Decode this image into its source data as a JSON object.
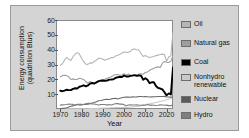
{
  "chart_data": {
    "type": "line",
    "title": "",
    "xlabel": "Year",
    "ylabel_line1": "Energy consumption",
    "ylabel_line2": "(quadrillion Btus)",
    "xlim": [
      1968,
      2023
    ],
    "ylim": [
      0,
      60
    ],
    "xticks": [
      1970,
      1980,
      1990,
      2000,
      2010,
      2020
    ],
    "yticks": [
      10,
      20,
      30,
      40,
      50,
      60
    ],
    "grid": false,
    "legend_position": "right",
    "x": [
      1970,
      1971,
      1972,
      1973,
      1974,
      1975,
      1976,
      1977,
      1978,
      1979,
      1980,
      1981,
      1982,
      1983,
      1984,
      1985,
      1986,
      1987,
      1988,
      1989,
      1990,
      1991,
      1992,
      1993,
      1994,
      1995,
      1996,
      1997,
      1998,
      1999,
      2000,
      2001,
      2002,
      2003,
      2004,
      2005,
      2006,
      2007,
      2008,
      2009,
      2010,
      2011,
      2012,
      2013,
      2014,
      2015,
      2016,
      2017,
      2018,
      2019,
      2020,
      2021,
      2022
    ],
    "series": [
      {
        "name": "Oil",
        "color": "#b5b5b5",
        "width": 1.1,
        "values": [
          29.5,
          30.5,
          32.9,
          34.8,
          33.5,
          32.7,
          35.2,
          37.1,
          38.0,
          37.1,
          34.2,
          31.9,
          30.2,
          30.1,
          31.1,
          30.9,
          32.2,
          32.9,
          34.2,
          34.2,
          33.6,
          32.8,
          33.5,
          33.8,
          34.7,
          34.6,
          35.8,
          36.3,
          36.8,
          37.8,
          38.4,
          38.3,
          38.2,
          38.8,
          40.3,
          40.4,
          39.9,
          39.8,
          37.3,
          35.4,
          36.0,
          35.3,
          34.7,
          35.1,
          35.4,
          36.0,
          36.3,
          36.7,
          37.0,
          36.7,
          32.2,
          35.1,
          35.9
        ],
        "extrapolated_end": 52.0
      },
      {
        "name": "Natural gas",
        "color": "#9e9e9e",
        "width": 1.1,
        "values": [
          21.8,
          22.5,
          22.7,
          22.5,
          21.7,
          19.9,
          20.3,
          19.9,
          20.0,
          20.7,
          20.4,
          19.9,
          18.5,
          17.4,
          18.5,
          17.8,
          16.7,
          17.7,
          18.6,
          19.7,
          19.7,
          20.1,
          20.7,
          21.2,
          21.7,
          22.7,
          23.1,
          23.2,
          22.8,
          22.9,
          23.8,
          22.8,
          23.6,
          22.8,
          22.9,
          22.6,
          22.2,
          23.6,
          23.8,
          23.4,
          24.6,
          24.9,
          26.1,
          26.8,
          27.5,
          28.2,
          28.4,
          28.0,
          30.9,
          32.0,
          31.5,
          31.3,
          32.3
        ],
        "extrapolated_end": 36.0
      },
      {
        "name": "Coal",
        "color": "#000000",
        "width": 1.9,
        "values": [
          12.3,
          12.0,
          12.4,
          13.0,
          12.7,
          12.7,
          13.6,
          14.0,
          13.8,
          15.0,
          15.4,
          16.0,
          15.3,
          15.9,
          17.1,
          17.5,
          17.3,
          18.0,
          18.8,
          19.0,
          19.2,
          19.0,
          19.1,
          19.8,
          19.9,
          20.1,
          21.0,
          21.4,
          21.7,
          21.6,
          22.6,
          21.9,
          21.9,
          22.3,
          22.5,
          22.8,
          22.4,
          22.7,
          22.4,
          19.7,
          20.8,
          19.7,
          17.4,
          18.0,
          18.0,
          15.5,
          14.2,
          13.8,
          13.2,
          11.3,
          9.2,
          10.5,
          9.8
        ],
        "extrapolated_end": 28.0
      },
      {
        "name": "Nonhydro renewable",
        "color": "#c9c9c9",
        "width": 1.1,
        "values": [
          0.1,
          0.1,
          0.1,
          0.1,
          0.1,
          0.1,
          0.1,
          0.1,
          0.1,
          0.1,
          0.1,
          0.1,
          0.2,
          0.2,
          0.3,
          0.3,
          0.3,
          0.3,
          0.4,
          0.5,
          0.6,
          0.6,
          0.7,
          0.7,
          0.8,
          0.8,
          0.9,
          0.9,
          1.0,
          1.0,
          1.1,
          1.1,
          1.2,
          1.3,
          1.4,
          1.5,
          1.7,
          1.9,
          2.2,
          2.5,
          2.8,
          3.3,
          3.5,
          3.8,
          4.1,
          4.4,
          4.7,
          5.1,
          5.4,
          5.7,
          6.2,
          6.7,
          7.0
        ],
        "extrapolated_end": 8.2
      },
      {
        "name": "Nuclear",
        "color": "#6a6a6a",
        "width": 1.1,
        "values": [
          0.2,
          0.4,
          0.6,
          0.9,
          1.3,
          1.9,
          2.1,
          2.7,
          3.0,
          2.8,
          2.7,
          3.0,
          3.1,
          3.2,
          3.6,
          4.1,
          4.4,
          4.9,
          5.6,
          5.7,
          6.1,
          6.4,
          6.5,
          6.4,
          6.8,
          7.1,
          7.2,
          6.7,
          7.2,
          7.6,
          7.9,
          8.0,
          8.1,
          7.9,
          8.2,
          8.1,
          8.2,
          8.4,
          8.4,
          8.3,
          8.4,
          8.3,
          8.1,
          8.2,
          8.3,
          8.3,
          8.4,
          8.4,
          8.4,
          8.5,
          8.2,
          8.1,
          8.0
        ],
        "extrapolated_end": 8.0
      },
      {
        "name": "Hydro",
        "color": "#7f7f7f",
        "width": 1.1,
        "values": [
          2.6,
          2.8,
          2.9,
          3.0,
          3.3,
          3.2,
          3.1,
          2.5,
          3.1,
          3.1,
          3.1,
          3.0,
          3.5,
          3.9,
          3.8,
          3.4,
          3.4,
          3.0,
          2.7,
          3.0,
          3.0,
          3.0,
          2.6,
          3.0,
          2.7,
          3.2,
          3.6,
          3.6,
          3.3,
          3.3,
          2.8,
          2.2,
          2.7,
          2.8,
          2.7,
          2.7,
          2.9,
          2.5,
          2.5,
          2.7,
          2.5,
          3.1,
          2.6,
          2.6,
          2.5,
          2.4,
          2.5,
          2.8,
          2.7,
          2.5,
          2.6,
          2.3,
          2.3
        ],
        "extrapolated_end": 2.6
      }
    ]
  },
  "legend": {
    "items": [
      {
        "label": "Oil",
        "color": "#b5b5b5"
      },
      {
        "label": "Natural gas",
        "color": "#9e9e9e"
      },
      {
        "label": "Coal",
        "color": "#000000"
      },
      {
        "label": "Nonhydro\nrenewable",
        "color": "#c9c9c9"
      },
      {
        "label": "Nuclear",
        "color": "#5a5a5a"
      },
      {
        "label": "Hydro",
        "color": "#7f7f7f"
      }
    ]
  },
  "colors": {
    "panel_background": "#d4d4d4",
    "panel_border": "#9a9a9a",
    "plot_background": "#ffffff",
    "axis": "#8a8a8a",
    "text": "#111111"
  }
}
